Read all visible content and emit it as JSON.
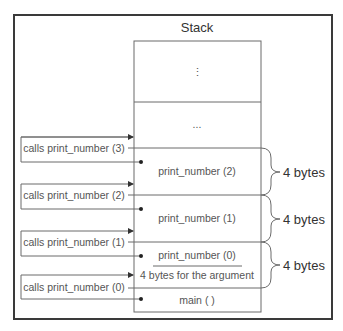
{
  "title": "Stack",
  "stack": {
    "top_placeholder": "⋮",
    "ellipsis": "...",
    "frames": [
      {
        "label": "print_number (2)"
      },
      {
        "label": "print_number (1)"
      },
      {
        "label": "print_number (0)"
      },
      {
        "label": "4 bytes for the argument"
      },
      {
        "label": "main ( )"
      }
    ]
  },
  "calls": [
    {
      "label": "calls print_number (3)"
    },
    {
      "label": "calls print_number (2)"
    },
    {
      "label": "calls print_number (1)"
    },
    {
      "label": "calls print_number (0)"
    }
  ],
  "braces": [
    {
      "label": "4 bytes"
    },
    {
      "label": "4 bytes"
    },
    {
      "label": "4 bytes"
    }
  ],
  "colors": {
    "frame": "#3a3a3a",
    "line": "#6a6a6a",
    "text": "#555555"
  }
}
